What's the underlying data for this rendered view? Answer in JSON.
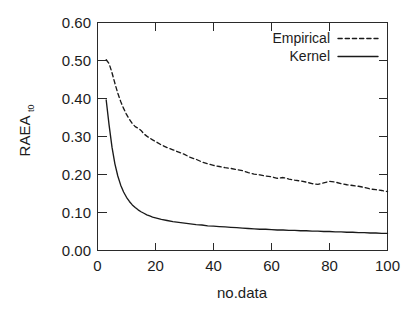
{
  "chart_data": {
    "type": "line",
    "title": "",
    "subtitle": "",
    "xlabel": "no.data",
    "ylabel": "RAEA",
    "ylabel_subscript": "t0",
    "xlim": [
      0,
      100
    ],
    "ylim": [
      0.0,
      0.6
    ],
    "xticks": [
      0,
      20,
      40,
      60,
      80,
      100
    ],
    "xtick_labels": [
      "0",
      "20",
      "40",
      "60",
      "80",
      "100"
    ],
    "yticks": [
      0.0,
      0.1,
      0.2,
      0.3,
      0.4,
      0.5,
      0.6
    ],
    "ytick_labels": [
      "0.00",
      "0.10",
      "0.20",
      "0.30",
      "0.40",
      "0.50",
      "0.60"
    ],
    "grid": false,
    "legend_position": "top-right-inside",
    "x": [
      3,
      4,
      5,
      6,
      7,
      8,
      9,
      10,
      11,
      12,
      13,
      14,
      15,
      16,
      17,
      18,
      19,
      20,
      22,
      24,
      26,
      28,
      30,
      32,
      34,
      36,
      38,
      40,
      42,
      44,
      46,
      48,
      50,
      52,
      54,
      56,
      58,
      60,
      62,
      64,
      66,
      68,
      70,
      72,
      74,
      76,
      78,
      80,
      82,
      84,
      86,
      88,
      90,
      92,
      94,
      96,
      98,
      100
    ],
    "series": [
      {
        "name": "Empirical",
        "style": "dashed",
        "color": "#1a1a1a",
        "values": [
          0.502,
          0.492,
          0.468,
          0.44,
          0.414,
          0.392,
          0.374,
          0.358,
          0.345,
          0.334,
          0.326,
          0.322,
          0.316,
          0.307,
          0.301,
          0.296,
          0.291,
          0.287,
          0.278,
          0.271,
          0.265,
          0.259,
          0.253,
          0.245,
          0.24,
          0.233,
          0.228,
          0.224,
          0.221,
          0.218,
          0.216,
          0.213,
          0.21,
          0.205,
          0.201,
          0.199,
          0.196,
          0.194,
          0.19,
          0.192,
          0.188,
          0.185,
          0.183,
          0.18,
          0.176,
          0.174,
          0.178,
          0.182,
          0.18,
          0.176,
          0.173,
          0.171,
          0.169,
          0.166,
          0.162,
          0.16,
          0.158,
          0.155
        ]
      },
      {
        "name": "Kernel",
        "style": "solid",
        "color": "#1a1a1a",
        "values": [
          0.396,
          0.33,
          0.272,
          0.228,
          0.196,
          0.172,
          0.154,
          0.14,
          0.129,
          0.12,
          0.113,
          0.107,
          0.102,
          0.098,
          0.094,
          0.091,
          0.088,
          0.086,
          0.082,
          0.079,
          0.076,
          0.074,
          0.072,
          0.07,
          0.068,
          0.067,
          0.065,
          0.064,
          0.063,
          0.062,
          0.061,
          0.06,
          0.059,
          0.058,
          0.057,
          0.056,
          0.056,
          0.055,
          0.054,
          0.054,
          0.053,
          0.053,
          0.052,
          0.052,
          0.051,
          0.051,
          0.05,
          0.05,
          0.049,
          0.049,
          0.048,
          0.048,
          0.047,
          0.047,
          0.046,
          0.046,
          0.045,
          0.045
        ]
      }
    ]
  },
  "legend": {
    "entries": [
      {
        "label": "Empirical",
        "style": "dashed"
      },
      {
        "label": "Kernel",
        "style": "solid"
      }
    ]
  }
}
